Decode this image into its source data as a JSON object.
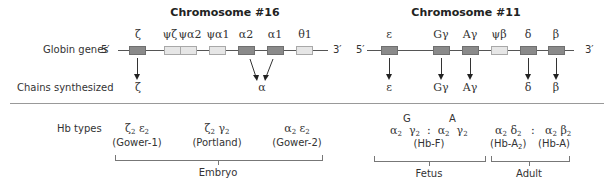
{
  "chr16": {
    "title": "Chromosome #16",
    "row_label": "Globin genes",
    "five_prime": "5′",
    "three_prime": "3′",
    "genes": [
      {
        "name": "ζ",
        "type": "active"
      },
      {
        "name": "ψζ",
        "type": "pseudo"
      },
      {
        "name": "ψα2",
        "type": "pseudo"
      },
      {
        "name": "ψα1",
        "type": "pseudo"
      },
      {
        "name": "α2",
        "type": "active"
      },
      {
        "name": "α1",
        "type": "active"
      },
      {
        "name": "θ1",
        "type": "pseudo"
      }
    ],
    "chains": [
      "ζ",
      "α"
    ]
  },
  "chr11": {
    "title": "Chromosome #11",
    "five_prime": "5′",
    "three_prime": "3′",
    "genes": [
      {
        "name": "ε",
        "type": "active"
      },
      {
        "name": "Gγ",
        "type": "active"
      },
      {
        "name": "Aγ",
        "type": "active"
      },
      {
        "name": "ψβ",
        "type": "pseudo"
      },
      {
        "name": "δ",
        "type": "active"
      },
      {
        "name": "β",
        "type": "active"
      }
    ],
    "chains": [
      "ε",
      "Gγ",
      "Aγ",
      "δ",
      "β"
    ]
  },
  "chains_label": "Chains synthesized",
  "hb": {
    "label": "Hb types",
    "embryo": {
      "group_label": "Embryo",
      "types": [
        {
          "a": "ζ",
          "b": "ε",
          "sub": "2",
          "name": "(Gower-1)"
        },
        {
          "a": "ζ",
          "b": "γ",
          "sub": "2",
          "name": "(Portland)"
        },
        {
          "a": "α",
          "b": "ε",
          "sub": "2",
          "name": "(Gower-2)"
        }
      ]
    },
    "fetus": {
      "group_label": "Fetus",
      "sup_g": "G",
      "sup_a": "A",
      "a": "α",
      "b": "γ",
      "sub": "2",
      "sep": ":",
      "name": "(Hb-F)"
    },
    "adult": {
      "group_label": "Adult",
      "t1": {
        "a": "α",
        "b": "δ",
        "sub": "2",
        "name_pre": "(Hb-A",
        "name_sub": "2",
        "name_post": ")"
      },
      "sep": ":",
      "t2": {
        "a": "α",
        "b": "β",
        "sub": "2",
        "name": "(Hb-A)"
      }
    }
  },
  "colors": {
    "active_gene": "#8a8a8a",
    "pseudo_gene": "#e6e6e6",
    "line": "#555555",
    "divider": "#999999"
  }
}
